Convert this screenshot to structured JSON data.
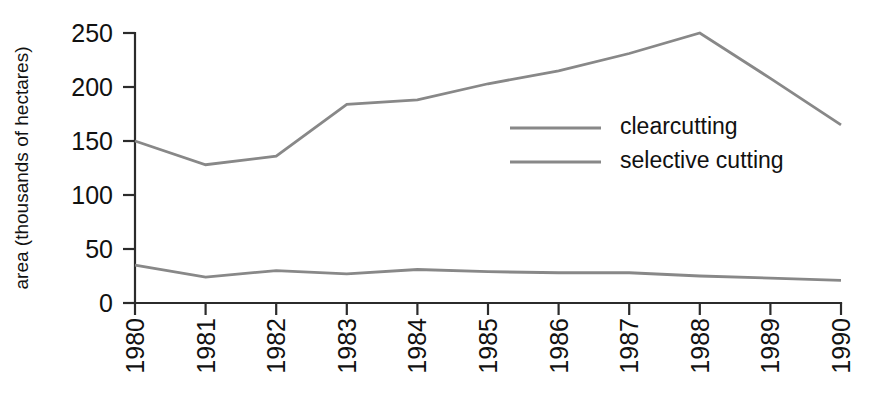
{
  "chart_data": {
    "type": "line",
    "title": "",
    "subtitle": "",
    "xlabel": "",
    "ylabel": "area (thousands of hectares)",
    "categories": [
      "1980",
      "1981",
      "1982",
      "1983",
      "1984",
      "1985",
      "1986",
      "1987",
      "1988",
      "1989",
      "1990"
    ],
    "x": [
      1980,
      1981,
      1982,
      1983,
      1984,
      1985,
      1986,
      1987,
      1988,
      1989,
      1990
    ],
    "series": [
      {
        "name": "clearcutting",
        "values": [
          150,
          128,
          136,
          184,
          188,
          203,
          215,
          231,
          250,
          208,
          165
        ],
        "color": "#888888"
      },
      {
        "name": "selective cutting",
        "values": [
          35,
          24,
          30,
          27,
          31,
          29,
          28,
          28,
          25,
          23,
          21
        ],
        "color": "#888888"
      }
    ],
    "ylim": [
      0,
      250
    ],
    "yticks": [
      0,
      50,
      100,
      150,
      200,
      250
    ],
    "ytick_labels": [
      "0",
      "50",
      "100",
      "150",
      "200",
      "250"
    ],
    "xtick_labels": [
      "1980",
      "1981",
      "1982",
      "1983",
      "1984",
      "1985",
      "1986",
      "1987",
      "1988",
      "1989",
      "1990"
    ],
    "xtick_rotation": -90,
    "grid": false,
    "legend_position": "inside-upper-right",
    "legend_entries": [
      "clearcutting",
      "selective cutting"
    ],
    "axis_color": "#2b2b2b",
    "background_color": "#ffffff",
    "annotations": []
  },
  "layout": {
    "plot_left": 135,
    "plot_right": 841,
    "plot_top": 33,
    "plot_bottom": 303,
    "y_value_max": 250,
    "y_value_min": 0,
    "legend_x_line_start": 510,
    "legend_x_line_end": 601,
    "legend_x_text": 620,
    "legend_y_first": 128,
    "legend_y_second": 162,
    "ylabel_x": 28,
    "ylabel_y": 168,
    "xlabel_y": 318
  }
}
